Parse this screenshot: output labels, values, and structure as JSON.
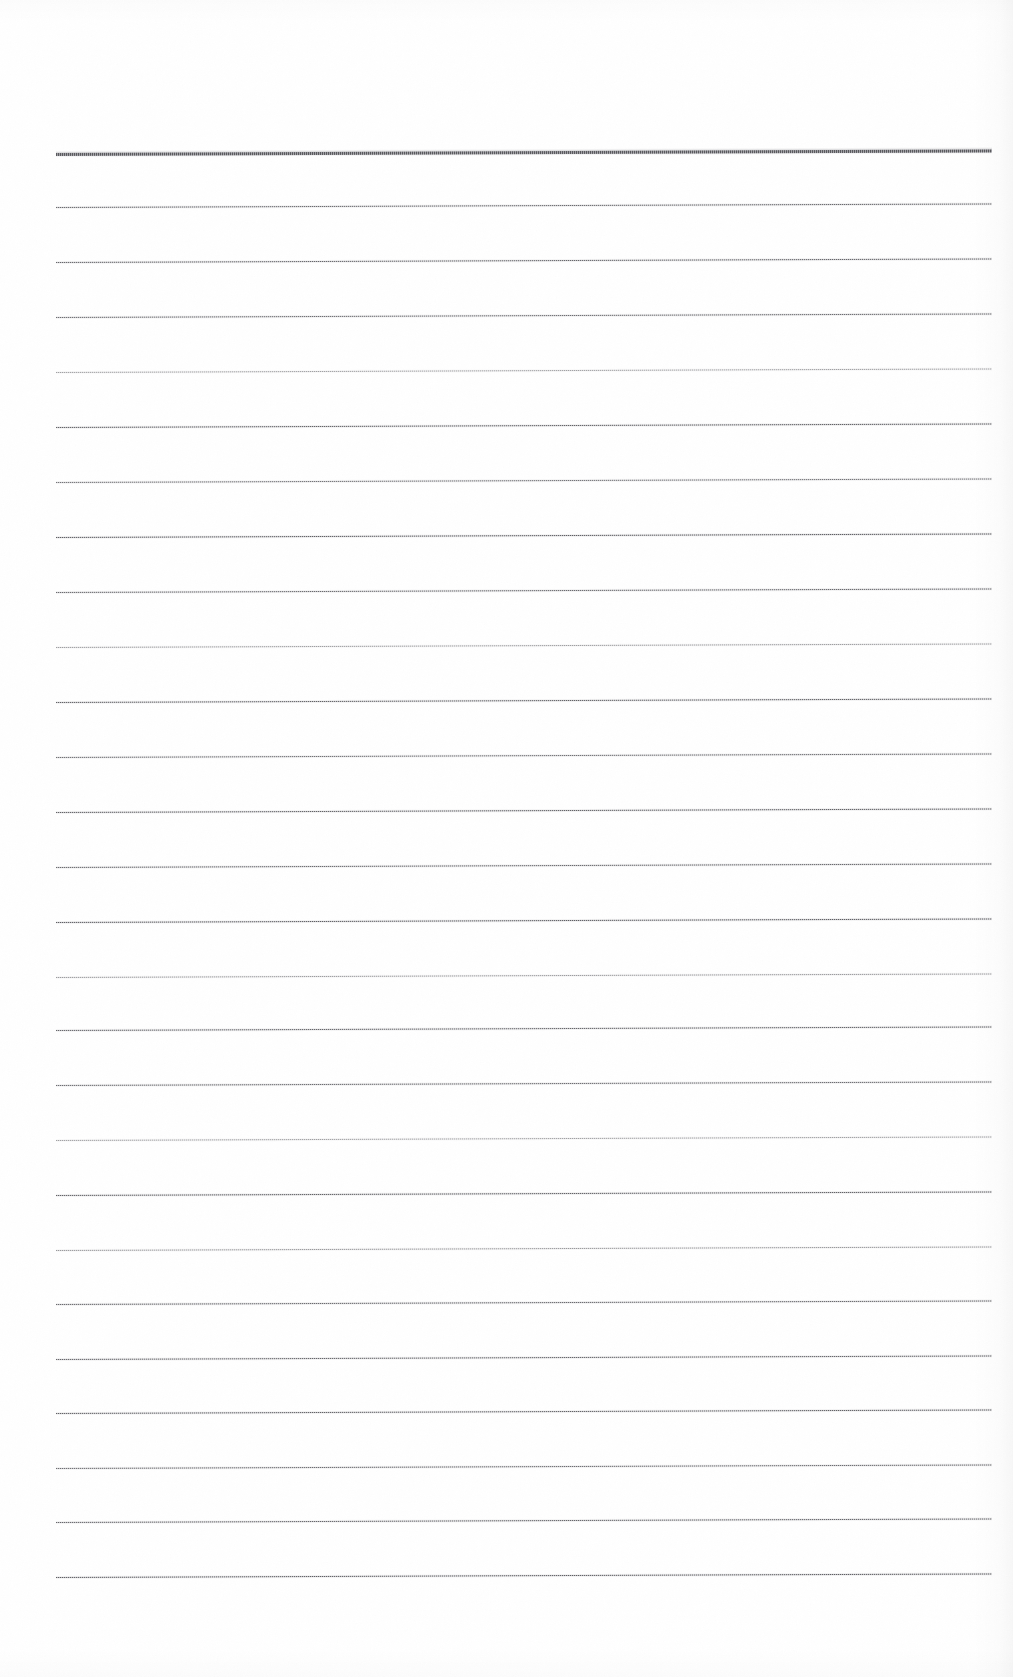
{
  "document": {
    "kind": "scanned-lined-paper",
    "description": "Blank scanned ruled notebook page with no handwriting or printed text",
    "page_width": 1013,
    "page_height": 1677,
    "background_color": "#ffffff",
    "rule_color": "#56565a",
    "rule_color_light": "#96969c",
    "visible_text": "",
    "handwriting_present": false
  },
  "layout": {
    "rule_left_x": 56,
    "rule_right_x": 992,
    "first_rule_y": 153,
    "last_rule_y": 1577,
    "rule_spacing": 54.8,
    "rule_count": 27,
    "top_margin": 153,
    "bottom_margin": 100,
    "left_margin": 56,
    "right_margin": 21,
    "skew_degrees": -0.22
  },
  "rules": [
    {
      "index": 0,
      "y": 153,
      "weight": "header",
      "opacity": 1.0
    },
    {
      "index": 1,
      "y": 207,
      "weight": "normal",
      "opacity": 0.86
    },
    {
      "index": 2,
      "y": 262,
      "weight": "normal",
      "opacity": 0.88
    },
    {
      "index": 3,
      "y": 317,
      "weight": "normal",
      "opacity": 0.84
    },
    {
      "index": 4,
      "y": 372,
      "weight": "normal",
      "opacity": 0.72
    },
    {
      "index": 5,
      "y": 427,
      "weight": "normal",
      "opacity": 0.9
    },
    {
      "index": 6,
      "y": 482,
      "weight": "normal",
      "opacity": 0.8
    },
    {
      "index": 7,
      "y": 537,
      "weight": "normal",
      "opacity": 0.92
    },
    {
      "index": 8,
      "y": 592,
      "weight": "normal",
      "opacity": 0.86
    },
    {
      "index": 9,
      "y": 647,
      "weight": "normal",
      "opacity": 0.74
    },
    {
      "index": 10,
      "y": 702,
      "weight": "normal",
      "opacity": 0.9
    },
    {
      "index": 11,
      "y": 757,
      "weight": "normal",
      "opacity": 0.82
    },
    {
      "index": 12,
      "y": 812,
      "weight": "normal",
      "opacity": 0.9
    },
    {
      "index": 13,
      "y": 867,
      "weight": "normal",
      "opacity": 0.86
    },
    {
      "index": 14,
      "y": 922,
      "weight": "normal",
      "opacity": 0.92
    },
    {
      "index": 15,
      "y": 977,
      "weight": "normal",
      "opacity": 0.76
    },
    {
      "index": 16,
      "y": 1030,
      "weight": "normal",
      "opacity": 0.88
    },
    {
      "index": 17,
      "y": 1085,
      "weight": "normal",
      "opacity": 0.84
    },
    {
      "index": 18,
      "y": 1140,
      "weight": "normal",
      "opacity": 0.72
    },
    {
      "index": 19,
      "y": 1195,
      "weight": "normal",
      "opacity": 0.9
    },
    {
      "index": 20,
      "y": 1250,
      "weight": "normal",
      "opacity": 0.78
    },
    {
      "index": 21,
      "y": 1304,
      "weight": "normal",
      "opacity": 0.86
    },
    {
      "index": 22,
      "y": 1359,
      "weight": "normal",
      "opacity": 0.88
    },
    {
      "index": 23,
      "y": 1413,
      "weight": "normal",
      "opacity": 0.9
    },
    {
      "index": 24,
      "y": 1468,
      "weight": "normal",
      "opacity": 0.84
    },
    {
      "index": 25,
      "y": 1522,
      "weight": "normal",
      "opacity": 0.88
    },
    {
      "index": 26,
      "y": 1577,
      "weight": "normal",
      "opacity": 0.92
    }
  ]
}
